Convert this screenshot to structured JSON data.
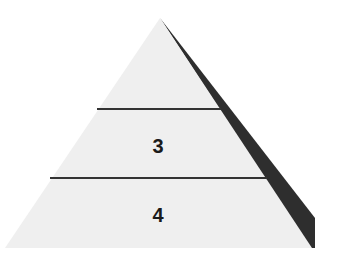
{
  "diagram": {
    "type": "pyramid",
    "levels": [
      {
        "index": 1,
        "label": ""
      },
      {
        "index": 2,
        "label": "3"
      },
      {
        "index": 3,
        "label": "4"
      }
    ],
    "colors": {
      "face": "#efefef",
      "shadow": "#2e2e2e",
      "divider": "#333333",
      "text": "#1a1a1a"
    }
  }
}
